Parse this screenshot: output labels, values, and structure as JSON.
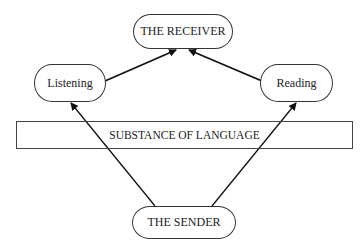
{
  "diagram": {
    "nodes": {
      "receiver": {
        "label": "THE RECEIVER"
      },
      "listening": {
        "label": "Listening"
      },
      "reading": {
        "label": "Reading"
      },
      "sender": {
        "label": "THE SENDER"
      }
    },
    "band": {
      "label": "SUBSTANCE OF LANGUAGE"
    },
    "edges": [
      {
        "from": "sender",
        "to": "listening"
      },
      {
        "from": "sender",
        "to": "reading"
      },
      {
        "from": "listening",
        "to": "receiver"
      },
      {
        "from": "reading",
        "to": "receiver"
      }
    ]
  }
}
